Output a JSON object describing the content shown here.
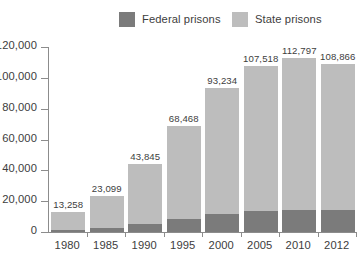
{
  "legend": {
    "items": [
      {
        "label": "Federal prisons",
        "color": "#7b7b7b",
        "key": "federal"
      },
      {
        "label": "State prisons",
        "color": "#bdbdbd",
        "key": "state"
      }
    ]
  },
  "colors": {
    "federal": "#7b7b7b",
    "state": "#bdbdbd",
    "axis": "#8c8c8c",
    "text": "#3d3d3d",
    "background": "#ffffff"
  },
  "chart_data": {
    "type": "bar",
    "title": "",
    "subtitle": "",
    "xlabel": "",
    "ylabel": "",
    "stacked": true,
    "grid": false,
    "legend_position": "top-center",
    "ylim": [
      0,
      120000
    ],
    "yticks": [
      0,
      20000,
      40000,
      60000,
      80000,
      100000,
      120000
    ],
    "ytick_labels": [
      "0",
      "20,000",
      "40,000",
      "60,000",
      "80,000",
      "100,000",
      "120,000"
    ],
    "categories": [
      "1980",
      "1985",
      "1990",
      "1995",
      "2000",
      "2005",
      "2010",
      "2012"
    ],
    "totals": [
      13258,
      23099,
      43845,
      68468,
      93234,
      107518,
      112797,
      108866
    ],
    "total_labels": [
      "13,258",
      "23,099",
      "43,845",
      "68,468",
      "93,234",
      "107,518",
      "112,797",
      "108,866"
    ],
    "series": [
      {
        "name": "Federal prisons",
        "key": "federal",
        "color": "#7b7b7b",
        "values": [
          1500,
          2500,
          5000,
          8500,
          12000,
          13500,
          14500,
          14000
        ]
      },
      {
        "name": "State prisons",
        "key": "state",
        "color": "#bdbdbd",
        "values": [
          11758,
          20599,
          38845,
          59968,
          81234,
          94018,
          98297,
          94866
        ]
      }
    ]
  }
}
